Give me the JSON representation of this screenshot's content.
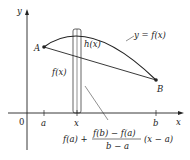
{
  "diagram": {
    "type": "mean-value-theorem-figure",
    "axes": {
      "x_label": "x",
      "y_label": "y",
      "origin_label": "0"
    },
    "x_ticks": [
      {
        "label": "a"
      },
      {
        "label": "x"
      },
      {
        "label": "b"
      }
    ],
    "points": [
      {
        "label": "A"
      },
      {
        "label": "B"
      }
    ],
    "curve_label": "y = f(x)",
    "segment_labels": {
      "h": "h(x)",
      "f": "f(x)"
    },
    "secant_formula": {
      "lead": "f(a) +",
      "numerator": "f(b) − f(a)",
      "denominator": "b − a",
      "tail": "(x − a)"
    },
    "colors": {
      "ink": "#222222",
      "background": "#ffffff"
    }
  }
}
